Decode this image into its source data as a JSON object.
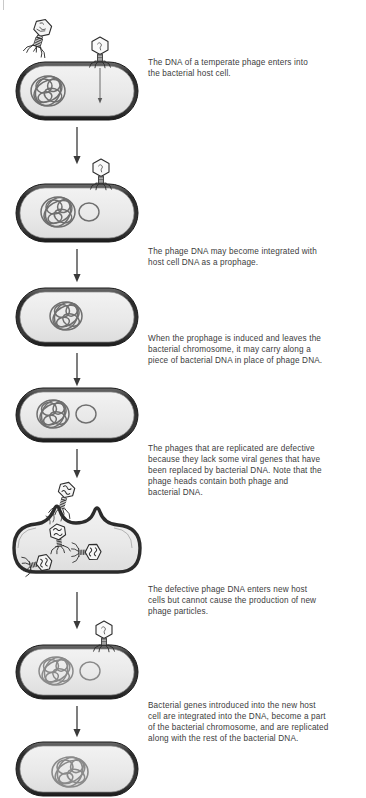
{
  "figure": {
    "background_color": "#ffffff",
    "text_color": "#3c3c3c",
    "cell_outline_color": "#2b2b2b",
    "cell_fill_color": "#ebebeb",
    "dna_color": "#6e6e6e",
    "arrow_color": "#3a3a3a"
  },
  "captions": [
    {
      "id": "caption-1",
      "text": "The DNA of a temperate phage enters into\nthe bacterial host cell."
    },
    {
      "id": "caption-2",
      "text": "The phage DNA may become integrated with\nhost cell DNA as a prophage."
    },
    {
      "id": "caption-3",
      "text": "When the prophage is induced and leaves the\nbacterial chromosome, it may carry along a\npiece of bacterial DNA in place of phage DNA."
    },
    {
      "id": "caption-4",
      "text": "The phages that are replicated are defective\nbecause they lack some viral genes that have\nbeen replaced by bacterial DNA.  Note that the\nphage heads contain both phage and\nbacterial DNA."
    },
    {
      "id": "caption-5",
      "text": "The defective phage DNA enters new host\ncells but cannot cause the production of new\nphage particles."
    },
    {
      "id": "caption-6",
      "text": "Bacterial genes introduced into the new host\ncell are integrated into the DNA, become a part\nof the bacterial chromosome, and are replicated\nalong with the rest of the bacterial DNA."
    }
  ],
  "stages": [
    {
      "id": "stage-1",
      "label": "phage-adsorbs-and-injects-dna",
      "cell": "bacterium-with-chromosome",
      "features": [
        "free-phage",
        "attached-phage",
        "injection-arrow",
        "bacterial-chromosome"
      ]
    },
    {
      "id": "stage-2",
      "label": "prophage-integration",
      "cell": "bacterium-with-chromosome-and-prophage",
      "features": [
        "attached-phage",
        "bacterial-chromosome",
        "phage-dna-circle"
      ]
    },
    {
      "id": "stage-3",
      "label": "prophage-integrated",
      "cell": "bacterium-with-chromosome",
      "features": [
        "bacterial-chromosome"
      ]
    },
    {
      "id": "stage-4",
      "label": "prophage-induced-excision",
      "cell": "bacterium-with-chromosome-and-excised-dna",
      "features": [
        "bacterial-chromosome",
        "excised-dna-circle"
      ]
    },
    {
      "id": "stage-5",
      "label": "lysis-releasing-defective-phages",
      "cell": "lysing-bacterium",
      "features": [
        "released-phage",
        "internal-phages",
        "burst-envelope"
      ]
    },
    {
      "id": "stage-6",
      "label": "defective-phage-infects-new-host",
      "cell": "bacterium-with-chromosome-and-transduced-dna",
      "features": [
        "attached-phage",
        "bacterial-chromosome",
        "transduced-dna-circle"
      ]
    },
    {
      "id": "stage-7",
      "label": "transduced-dna-integrated",
      "cell": "bacterium-with-recombinant-chromosome",
      "features": [
        "bacterial-chromosome"
      ]
    }
  ],
  "connector_arrows": [
    {
      "id": "arrow-1-2",
      "from": "stage-1",
      "to": "stage-2"
    },
    {
      "id": "arrow-2-3",
      "from": "stage-2",
      "to": "stage-3"
    },
    {
      "id": "arrow-3-4",
      "from": "stage-3",
      "to": "stage-4"
    },
    {
      "id": "arrow-4-5",
      "from": "stage-4",
      "to": "stage-5"
    },
    {
      "id": "arrow-5-6",
      "from": "stage-5",
      "to": "stage-6"
    },
    {
      "id": "arrow-6-7",
      "from": "stage-6",
      "to": "stage-7"
    }
  ]
}
